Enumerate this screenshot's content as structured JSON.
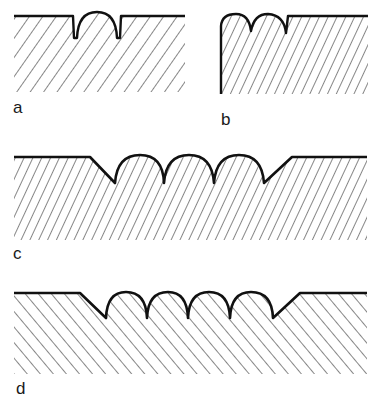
{
  "figure": {
    "ink_color": "#111111",
    "background": "#ffffff",
    "panels": [
      {
        "id": "a",
        "label": "a",
        "profile": "single rounded bead between two narrow slots"
      },
      {
        "id": "b",
        "label": "b",
        "profile": "edge with two rounded beads and a notch"
      },
      {
        "id": "c",
        "label": "c",
        "profile": "three rounded beads in a chamfered recess"
      },
      {
        "id": "d",
        "label": "d",
        "profile": "four rounded beads in a chamfered recess"
      }
    ]
  }
}
